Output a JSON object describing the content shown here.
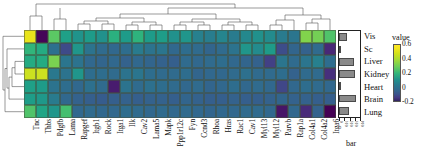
{
  "chart_data": {
    "type": "heatmap",
    "title": "",
    "xlabel": "",
    "ylabel": "",
    "columns": [
      "Tnc",
      "Thbs",
      "Pdgfb",
      "Lama",
      "Rapgef",
      "Itgb1",
      "Rock",
      "Itga1",
      "Ilk",
      "Cav2",
      "Lama5",
      "Mapk",
      "Ppp1r12c",
      "Fyn",
      "Ccnd3",
      "Rhoa",
      "Hras",
      "Rac1",
      "Cav1",
      "Myl13",
      "Myl12",
      "Parvb",
      "Rap1a",
      "Col4a1",
      "Col4a2",
      "Itga6"
    ],
    "rows": [
      "Vis",
      "Sc",
      "Liver",
      "Kidney",
      "Heart",
      "Brain",
      "Lung"
    ],
    "colorbar": {
      "label": "value",
      "ticks": [
        "0.6",
        "0.4",
        "0.2",
        "0",
        "-0.2"
      ],
      "vmin": -0.25,
      "vmax": 0.65,
      "colormap": "viridis"
    },
    "values": [
      [
        0.62,
        -0.24,
        0.42,
        0.26,
        0.21,
        0.24,
        0.2,
        0.32,
        0.24,
        0.33,
        0.24,
        0.25,
        0.2,
        0.22,
        0.14,
        0.13,
        0.16,
        0.12,
        0.17,
        0.2,
        0.18,
        0.12,
        0.1,
        0.48,
        0.46,
        0.4
      ],
      [
        0.34,
        0.3,
        0.08,
        -0.05,
        0.22,
        0.09,
        0.06,
        0.05,
        0.07,
        0.12,
        0.09,
        0.1,
        0.05,
        0.07,
        0.06,
        0.04,
        0.06,
        0.09,
        0.22,
        0.18,
        0.24,
        -0.04,
        0.04,
        0.03,
        0.06,
        -0.15
      ],
      [
        0.3,
        0.3,
        0.47,
        0.1,
        0.09,
        0.05,
        0.04,
        0.05,
        0.03,
        0.05,
        0.04,
        0.03,
        0.02,
        0.06,
        0.05,
        0.06,
        0.07,
        0.05,
        0.04,
        0.03,
        -0.08,
        0.1,
        0.06,
        0.1,
        0.14,
        0.07
      ],
      [
        0.58,
        0.58,
        0.11,
        0.09,
        0.22,
        0.07,
        0.07,
        0.06,
        0.09,
        0.1,
        0.07,
        0.06,
        0.06,
        0.07,
        0.04,
        0.05,
        0.05,
        0.06,
        0.08,
        0.06,
        0.06,
        0.07,
        0.03,
        0.06,
        0.06,
        -0.13
      ],
      [
        0.26,
        0.24,
        0.09,
        0.07,
        0.05,
        0.08,
        0.06,
        -0.18,
        0.09,
        0.06,
        0.08,
        0.07,
        0.06,
        0.05,
        0.06,
        0.04,
        0.05,
        0.07,
        0.05,
        0.06,
        0.05,
        -0.06,
        0.05,
        0.07,
        0.06,
        0.05
      ],
      [
        0.25,
        0.23,
        0.12,
        0.05,
        0.03,
        0.02,
        0.01,
        0.02,
        0.03,
        0.02,
        0.03,
        0.03,
        0.02,
        0.04,
        0.03,
        0.02,
        0.02,
        0.03,
        0.02,
        0.02,
        0.03,
        0.04,
        0.03,
        0.03,
        0.02,
        0.02
      ],
      [
        0.4,
        0.28,
        0.22,
        0.38,
        0.05,
        0.06,
        0.05,
        0.05,
        0.07,
        0.06,
        0.05,
        0.06,
        0.05,
        0.06,
        0.05,
        0.04,
        0.05,
        0.05,
        0.06,
        0.06,
        0.05,
        -0.2,
        0.05,
        -0.14,
        0.03,
        -0.25
      ]
    ],
    "side_bar": {
      "title": "bar",
      "tick_labels": [
        "0",
        "0.01",
        "0.02",
        "0.03",
        "0.04"
      ],
      "values": [
        0.018,
        0.001,
        0.033,
        0.034,
        0.004,
        0.036,
        0.022
      ],
      "max": 0.045
    },
    "row_dendrogram": true,
    "col_dendrogram": true
  }
}
